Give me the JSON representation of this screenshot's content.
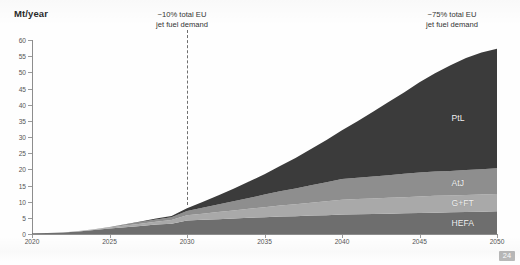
{
  "page": {
    "number": "24",
    "background_color": "#fefefe"
  },
  "axis_title": "Mt/year",
  "annotations": [
    {
      "name": "annotation-2030",
      "line1": "~10% total EU",
      "line2": "jet fuel demand",
      "at_year": 2030
    },
    {
      "name": "annotation-2050",
      "line1": "~75% total EU",
      "line2": "jet fuel demand",
      "at_year": 2050
    }
  ],
  "marker_line": {
    "year": 2030,
    "style": "dashed",
    "color": "#6f6f6f"
  },
  "series_labels": [
    {
      "name": "PtL",
      "color": "#3b3b3b"
    },
    {
      "name": "AtJ",
      "color": "#8e8e8e"
    },
    {
      "name": "G+FT",
      "color": "#a9a9a9"
    },
    {
      "name": "HEFA",
      "color": "#6e6e6e"
    }
  ],
  "chart_data": {
    "type": "area",
    "stacked": true,
    "title": "",
    "subtitle": "",
    "xlabel": "",
    "ylabel": "Mt/year",
    "xlim": [
      2020,
      2050
    ],
    "ylim": [
      0,
      60
    ],
    "ytick_step": 5,
    "xtick_step": 5,
    "grid": false,
    "legend_position": "in-plot-right",
    "ytick_labels": [
      "0",
      "5",
      "10",
      "15",
      "20",
      "25",
      "30",
      "35",
      "40",
      "45",
      "50",
      "55",
      "60"
    ],
    "xtick_labels": [
      "2020",
      "2025",
      "2030",
      "2035",
      "2040",
      "2045",
      "2050"
    ],
    "x": [
      2020,
      2021,
      2022,
      2023,
      2024,
      2025,
      2026,
      2027,
      2028,
      2029,
      2030,
      2031,
      2032,
      2033,
      2034,
      2035,
      2036,
      2037,
      2038,
      2039,
      2040,
      2041,
      2042,
      2043,
      2044,
      2045,
      2046,
      2047,
      2048,
      2049,
      2050
    ],
    "series": [
      {
        "name": "HEFA",
        "color": "#6e6e6e",
        "values": [
          0.2,
          0.3,
          0.5,
          0.8,
          1.2,
          1.7,
          2.1,
          2.5,
          2.9,
          3.2,
          4.2,
          4.4,
          4.6,
          4.8,
          5.0,
          5.2,
          5.4,
          5.5,
          5.7,
          5.8,
          6.0,
          6.1,
          6.2,
          6.3,
          6.4,
          6.5,
          6.6,
          6.7,
          6.8,
          6.9,
          7.0
        ]
      },
      {
        "name": "G+FT",
        "color": "#a9a9a9",
        "values": [
          0.0,
          0.0,
          0.0,
          0.1,
          0.2,
          0.3,
          0.5,
          0.7,
          0.9,
          1.1,
          1.6,
          1.9,
          2.2,
          2.5,
          2.8,
          3.1,
          3.4,
          3.7,
          4.0,
          4.3,
          4.6,
          4.7,
          4.8,
          4.9,
          5.0,
          5.1,
          5.2,
          5.2,
          5.3,
          5.3,
          5.4
        ]
      },
      {
        "name": "AtJ",
        "color": "#8e8e8e",
        "values": [
          0.0,
          0.0,
          0.0,
          0.0,
          0.1,
          0.2,
          0.3,
          0.5,
          0.7,
          0.9,
          1.3,
          1.8,
          2.3,
          2.8,
          3.3,
          3.9,
          4.4,
          4.9,
          5.4,
          5.9,
          6.4,
          6.6,
          6.8,
          7.0,
          7.2,
          7.4,
          7.5,
          7.6,
          7.7,
          7.8,
          7.9
        ]
      },
      {
        "name": "PtL",
        "color": "#3b3b3b",
        "values": [
          0.0,
          0.0,
          0.0,
          0.0,
          0.0,
          0.0,
          0.1,
          0.2,
          0.3,
          0.4,
          0.9,
          1.8,
          2.8,
          3.9,
          5.1,
          6.3,
          7.8,
          9.4,
          11.2,
          13.1,
          15.1,
          17.5,
          20.0,
          22.6,
          25.2,
          27.9,
          30.4,
          32.7,
          34.6,
          36.1,
          37.0
        ]
      }
    ],
    "totals": [
      0.2,
      0.3,
      0.5,
      0.9,
      1.5,
      2.2,
      3.0,
      3.9,
      4.8,
      5.6,
      8.0,
      9.9,
      11.9,
      14.0,
      16.2,
      18.5,
      21.0,
      23.5,
      26.3,
      29.1,
      32.1,
      34.9,
      37.8,
      40.8,
      43.8,
      46.9,
      49.7,
      52.2,
      54.4,
      56.1,
      57.3
    ]
  }
}
